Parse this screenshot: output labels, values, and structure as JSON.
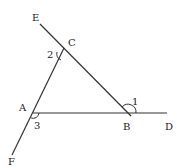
{
  "diagram": {
    "type": "geometry",
    "points": {
      "E": {
        "label": "E",
        "x": 40,
        "y": 24
      },
      "C": {
        "label": "C",
        "x": 63,
        "y": 47
      },
      "B": {
        "label": "B",
        "x": 128,
        "y": 113
      },
      "A": {
        "label": "A",
        "x": 33,
        "y": 113
      },
      "D": {
        "label": "D",
        "x": 167,
        "y": 113
      },
      "F": {
        "label": "F",
        "x": 12,
        "y": 155
      }
    },
    "angles": [
      {
        "label": "1",
        "vertex": "B"
      },
      {
        "label": "2",
        "vertex": "C"
      },
      {
        "label": "3",
        "vertex": "A"
      }
    ],
    "lines": [
      "E-B",
      "F-C",
      "A-D"
    ]
  }
}
